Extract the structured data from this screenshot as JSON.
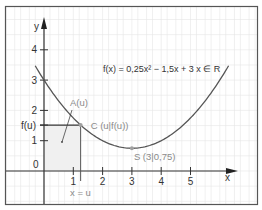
{
  "diagram": {
    "title_formula": "f(x) = 0,25x² − 1,5x + 3   x ∈ R",
    "function": {
      "a": 0.25,
      "b": -1.5,
      "c": 3,
      "domain_shown": [
        -0.3,
        6.3
      ]
    },
    "axes": {
      "x_label": "x",
      "y_label": "y",
      "x_ticks": [
        1,
        2,
        3,
        4,
        5
      ],
      "x_tick_labels": [
        "1",
        "2",
        "3",
        "4",
        "5"
      ],
      "y_ticks": [
        1,
        2,
        3,
        4
      ],
      "y_tick_labels": [
        "1",
        "2",
        "3",
        "4"
      ],
      "origin_label": "0",
      "x_range": [
        -1.3,
        7.3
      ],
      "y_range": [
        -1.1,
        5.4
      ]
    },
    "point_u": 1.25,
    "labels": {
      "area": "A(u)",
      "point_c": "C (u|f(u))",
      "f_u_tick": "f(u)",
      "x_equals_u": "x = u",
      "vertex": "S (3|0,75)"
    },
    "vertex": {
      "x": 3,
      "y": 0.75
    },
    "colors": {
      "curve": "#555555",
      "axis": "#333333",
      "grid": "#e6e6e6",
      "shade": "#f0f0f0",
      "point": "#a0a0a0",
      "border": "#555555",
      "gray_text": "#8a8a8a"
    }
  }
}
